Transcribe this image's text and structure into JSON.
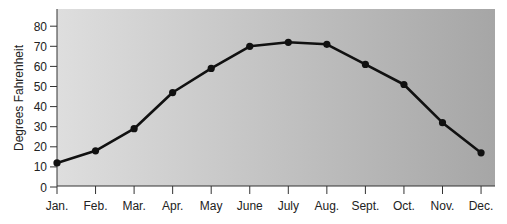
{
  "chart_data": {
    "type": "line",
    "title": "",
    "xlabel": "",
    "ylabel": "Degrees Fahrenheit",
    "categories": [
      "Jan.",
      "Feb.",
      "Mar.",
      "Apr.",
      "May",
      "June",
      "July",
      "Aug.",
      "Sept.",
      "Oct.",
      "Nov.",
      "Dec."
    ],
    "series": [
      {
        "name": "Temperature",
        "values": [
          12,
          18,
          29,
          47,
          59,
          70,
          72,
          71,
          61,
          51,
          32,
          17
        ]
      }
    ],
    "yticks": [
      0,
      10,
      20,
      30,
      40,
      50,
      60,
      70,
      80
    ],
    "ylim": [
      0,
      88
    ],
    "grid": false,
    "legend": "none",
    "background": {
      "gradient_left": "#dedede",
      "gradient_right": "#a6a6a6"
    },
    "line_color": "#111111"
  }
}
